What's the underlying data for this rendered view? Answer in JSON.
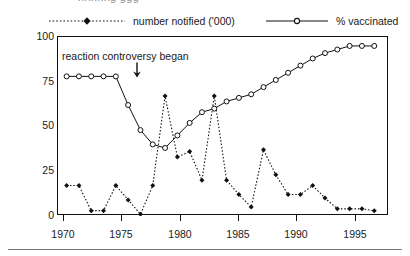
{
  "top_clipped_text": "nnnnng ggg",
  "legend": {
    "notified": {
      "label": "number notified ('000)",
      "style": "dotted-with-filled-marker",
      "color": "#111111"
    },
    "vaccinated": {
      "label": "% vaccinated",
      "style": "solid-with-open-circle-marker",
      "color": "#111111"
    }
  },
  "annotation": {
    "text": "reaction controversy began",
    "arrow": "down-arrow",
    "points_at_year": 1974
  },
  "chart_data": {
    "type": "line",
    "title": "",
    "subtitle": "",
    "xlabel": "",
    "ylabel": "",
    "xlim": [
      1969.3,
      1996.2
    ],
    "ylim": [
      0,
      100
    ],
    "grid": false,
    "legend_position": "top",
    "xticks": [
      1970,
      1975,
      1980,
      1985,
      1990,
      1995
    ],
    "yticks": [
      0,
      25,
      50,
      75,
      100
    ],
    "x": [
      1970,
      1971,
      1972,
      1973,
      1974,
      1975,
      1976,
      1977,
      1978,
      1979,
      1980,
      1981,
      1982,
      1983,
      1984,
      1985,
      1986,
      1987,
      1988,
      1989,
      1990,
      1991,
      1992,
      1993,
      1994,
      1995
    ],
    "series": [
      {
        "name": "number notified ('000)",
        "marker": "filled-diamond",
        "linestyle": "dotted",
        "values": [
          17,
          17,
          3,
          3,
          17,
          9,
          1,
          17,
          67,
          33,
          36,
          20,
          67,
          20,
          12,
          5,
          37,
          23,
          12,
          12,
          17,
          10,
          4,
          4,
          4,
          3
        ]
      },
      {
        "name": "% vaccinated",
        "marker": "open-circle",
        "linestyle": "solid",
        "values": [
          78,
          78,
          78,
          78,
          78,
          62,
          48,
          40,
          38,
          45,
          52,
          58,
          60,
          64,
          66,
          68,
          72,
          76,
          80,
          84,
          88,
          91,
          93,
          95,
          95,
          95
        ]
      }
    ]
  }
}
